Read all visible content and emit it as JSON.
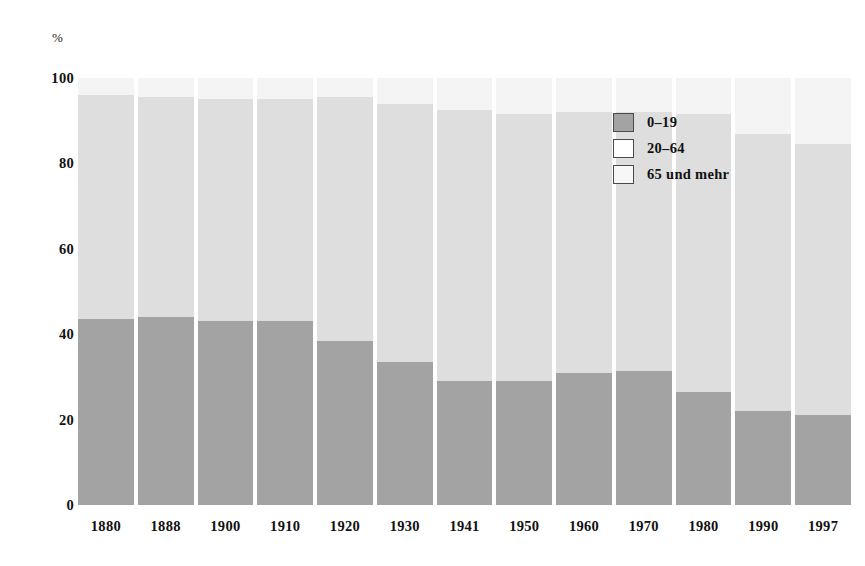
{
  "chart_data": {
    "type": "bar",
    "subtype": "stacked-percentage",
    "title": "",
    "xlabel": "",
    "ylabel": "%",
    "ylim": [
      0,
      100
    ],
    "yticks": [
      0,
      20,
      40,
      60,
      80,
      100
    ],
    "grid": false,
    "legend_position": "inside-top-right",
    "categories": [
      "1880",
      "1888",
      "1900",
      "1910",
      "1920",
      "1930",
      "1941",
      "1950",
      "1960",
      "1970",
      "1980",
      "1990",
      "1997"
    ],
    "series": [
      {
        "name": "0–19",
        "color": "#a3a3a3",
        "values": [
          43.5,
          44.0,
          43.0,
          43.0,
          38.5,
          33.5,
          29.0,
          29.0,
          31.0,
          31.5,
          26.5,
          22.0,
          21.0
        ]
      },
      {
        "name": "20–64",
        "color": "#dedede",
        "values": [
          52.5,
          51.5,
          52.0,
          52.0,
          57.0,
          60.5,
          63.5,
          62.5,
          61.0,
          60.5,
          65.0,
          65.0,
          63.5
        ]
      },
      {
        "name": "65 und mehr",
        "color": "#f4f4f4",
        "values": [
          4.0,
          4.5,
          5.0,
          5.0,
          4.5,
          6.0,
          7.5,
          8.5,
          8.0,
          8.0,
          8.5,
          13.0,
          15.5
        ]
      }
    ]
  },
  "axes": {
    "y_unit": "%",
    "y_ticks": [
      "100",
      "80",
      "60",
      "40",
      "20",
      "0"
    ],
    "x_ticks": [
      "1880",
      "1888",
      "1900",
      "1910",
      "1920",
      "1930",
      "1941",
      "1950",
      "1960",
      "1970",
      "1980",
      "1990",
      "1997"
    ]
  },
  "legend": {
    "items": [
      {
        "label": "0–19",
        "swatch": "legend-swatch-young"
      },
      {
        "label": "20–64",
        "swatch": "legend-swatch-mid"
      },
      {
        "label": "65 und mehr",
        "swatch": "legend-swatch-old"
      }
    ]
  }
}
